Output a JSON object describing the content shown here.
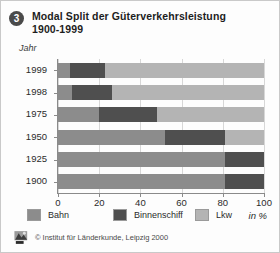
{
  "header": {
    "badge_number": "3",
    "title_line1": "Modal Split der Güterverkehrsleistung",
    "title_line2": "1900-1999"
  },
  "axes": {
    "y_axis_label": "Jahr",
    "x_unit_label": "in %",
    "x_ticks": [
      "0",
      "20",
      "40",
      "60",
      "80",
      "100"
    ]
  },
  "legend": {
    "items": [
      {
        "label": "Bahn",
        "color": "#8c8c8c",
        "icon": "legend-swatch-bahn"
      },
      {
        "label": "Binnenschiff",
        "color": "#4f4f4f",
        "icon": "legend-swatch-binnenschiff"
      },
      {
        "label": "Lkw",
        "color": "#b4b4b4",
        "icon": "legend-swatch-lkw"
      }
    ]
  },
  "footer": {
    "logo_icon": "ifl-logo-icon",
    "credit": "© Institut für Länderkunde, Leipzig 2000"
  },
  "chart_data": {
    "type": "bar",
    "orientation": "horizontal",
    "stacked": true,
    "title": "Modal Split der Güterverkehrsleistung 1900-1999",
    "xlabel": "in %",
    "ylabel": "Jahr",
    "xlim": [
      0,
      100
    ],
    "grid": true,
    "legend_position": "bottom",
    "categories": [
      "1999",
      "1998",
      "1975",
      "1950",
      "1925",
      "1900"
    ],
    "series": [
      {
        "name": "Bahn",
        "color": "#8c8c8c",
        "values": [
          6,
          7,
          20,
          52,
          81,
          81
        ]
      },
      {
        "name": "Binnenschiff",
        "color": "#4f4f4f",
        "values": [
          17,
          19,
          28,
          29,
          19,
          19
        ]
      },
      {
        "name": "Lkw",
        "color": "#b4b4b4",
        "values": [
          77,
          74,
          52,
          19,
          0,
          0
        ]
      }
    ],
    "tick_values": [
      0,
      20,
      40,
      60,
      80,
      100
    ]
  }
}
